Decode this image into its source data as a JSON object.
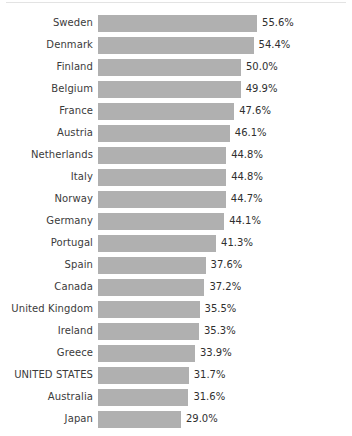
{
  "chart_data": {
    "type": "bar",
    "orientation": "horizontal",
    "title": "",
    "subtitle": "",
    "xlabel": "",
    "ylabel": "",
    "grid": false,
    "legend": false,
    "axis_visible": false,
    "value_suffix": "%",
    "xlim": [
      0,
      60
    ],
    "colors": {
      "bar_fill": "#b0b0b0",
      "label_text": "#3b3b3b",
      "value_text": "#2f2f2f",
      "background": "#ffffff",
      "top_rule": "#e3e3e3"
    },
    "categories": [
      "Sweden",
      "Denmark",
      "Finland",
      "Belgium",
      "France",
      "Austria",
      "Netherlands",
      "Italy",
      "Norway",
      "Germany",
      "Portugal",
      "Spain",
      "Canada",
      "United Kingdom",
      "Ireland",
      "Greece",
      "UNITED STATES",
      "Australia",
      "Japan"
    ],
    "values": [
      55.6,
      54.4,
      50.0,
      49.9,
      47.6,
      46.1,
      44.8,
      44.8,
      44.7,
      44.1,
      41.3,
      37.6,
      37.2,
      35.5,
      35.3,
      33.9,
      31.7,
      31.6,
      29.0
    ],
    "value_labels": [
      "55.6%",
      "54.4%",
      "50.0%",
      "49.9%",
      "47.6%",
      "46.1%",
      "44.8%",
      "44.8%",
      "44.7%",
      "44.1%",
      "41.3%",
      "37.6%",
      "37.2%",
      "35.5%",
      "35.3%",
      "33.9%",
      "31.7%",
      "31.6%",
      "29.0%"
    ],
    "highlighted_category": "UNITED STATES"
  },
  "layout": {
    "bar_start_x": 98,
    "px_per_unit": 2.86,
    "bar_height": 17,
    "row_pitch": 22,
    "label_width": 93
  }
}
